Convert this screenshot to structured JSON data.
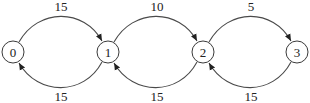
{
  "diagram": {
    "type": "state-transition-graph",
    "nodes": [
      {
        "id": "0",
        "label": "0",
        "cx": 13,
        "cy": 52
      },
      {
        "id": "1",
        "label": "1",
        "cx": 108,
        "cy": 52
      },
      {
        "id": "2",
        "label": "2",
        "cx": 203,
        "cy": 52
      },
      {
        "id": "3",
        "label": "3",
        "cx": 297,
        "cy": 52
      }
    ],
    "edges": [
      {
        "from": "0",
        "to": "1",
        "label": "15",
        "position": "top"
      },
      {
        "from": "1",
        "to": "2",
        "label": "10",
        "position": "top"
      },
      {
        "from": "2",
        "to": "3",
        "label": "5",
        "position": "top"
      },
      {
        "from": "1",
        "to": "0",
        "label": "15",
        "position": "bottom"
      },
      {
        "from": "2",
        "to": "1",
        "label": "15",
        "position": "bottom"
      },
      {
        "from": "3",
        "to": "2",
        "label": "15",
        "position": "bottom"
      }
    ],
    "colors": {
      "stroke": "#4a4a4a",
      "text": "#222222",
      "background": "#ffffff"
    }
  }
}
